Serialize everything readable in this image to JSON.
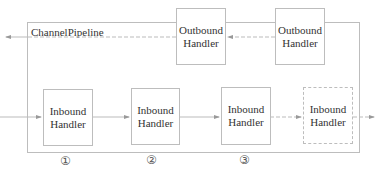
{
  "diagram": {
    "container_label": "ChannelPipeline",
    "outbound_handlers": [
      {
        "line1": "Outbound",
        "line2": "Handler"
      },
      {
        "line1": "Outbound",
        "line2": "Handler"
      }
    ],
    "inbound_handlers": [
      {
        "line1": "Inbound",
        "line2": "Handler",
        "style": "solid",
        "marker": "①"
      },
      {
        "line1": "Inbound",
        "line2": "Handler",
        "style": "solid",
        "marker": "②"
      },
      {
        "line1": "Inbound",
        "line2": "Handler",
        "style": "solid",
        "marker": "③"
      },
      {
        "line1": "Inbound",
        "line2": "Handler",
        "style": "dashed"
      }
    ],
    "colors": {
      "border": "#bdbdbd",
      "arrow": "#999999",
      "text": "#333333"
    }
  }
}
